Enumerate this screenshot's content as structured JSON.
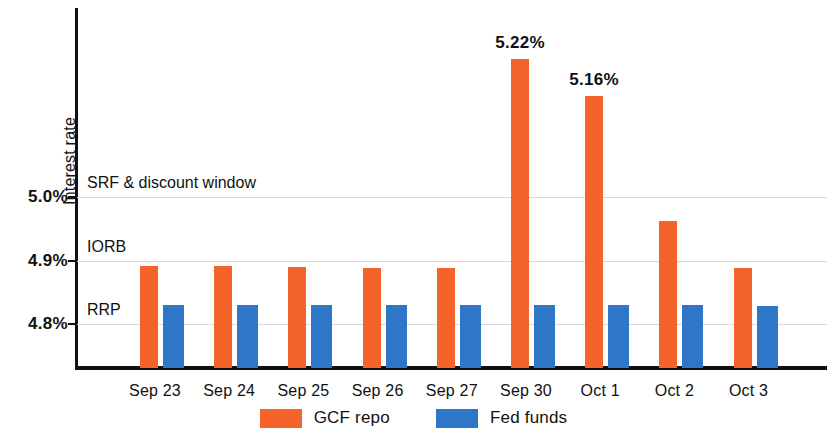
{
  "chart_data": {
    "type": "bar",
    "title": "",
    "xlabel": "",
    "ylabel": "Interest rate",
    "categories": [
      "Sep 23",
      "Sep 24",
      "Sep 25",
      "Sep 26",
      "Sep 27",
      "Sep 30",
      "Oct 1",
      "Oct 2",
      "Oct 3"
    ],
    "series": [
      {
        "name": "GCF repo",
        "color": "#F4642A",
        "values": [
          4.891,
          4.891,
          4.89,
          4.889,
          4.889,
          5.22,
          5.16,
          4.962,
          4.888
        ],
        "point_labels": [
          "",
          "",
          "",
          "",
          "",
          "5.22%",
          "5.16%",
          "",
          ""
        ]
      },
      {
        "name": "Fed funds",
        "color": "#2D76C8",
        "values": [
          4.83,
          4.83,
          4.83,
          4.83,
          4.83,
          4.83,
          4.83,
          4.83,
          4.828
        ],
        "point_labels": [
          "",
          "",
          "",
          "",
          "",
          "",
          "",
          "",
          ""
        ]
      }
    ],
    "ylim": [
      4.73,
      5.3
    ],
    "yticks": [
      4.8,
      4.9,
      5.0
    ],
    "ytick_labels": [
      "4.8%",
      "4.9%",
      "5.0%"
    ],
    "grid": true,
    "legend_position": "bottom-center",
    "reference_lines": [
      {
        "label": "SRF & discount window",
        "value": 5.0
      },
      {
        "label": "IORB",
        "value": 4.9
      },
      {
        "label": "RRP",
        "value": 4.8
      }
    ]
  },
  "axis": {
    "y_title": "Interest rate",
    "tick_5_0": "5.0%",
    "tick_4_9": "4.9%",
    "tick_4_8": "4.8%"
  },
  "reference_labels": {
    "srf": "SRF & discount window",
    "iorb": "IORB",
    "rrp": "RRP"
  },
  "xlabels": {
    "c0": "Sep 23",
    "c1": "Sep 24",
    "c2": "Sep 25",
    "c3": "Sep 26",
    "c4": "Sep 27",
    "c5": "Sep 30",
    "c6": "Oct 1",
    "c7": "Oct 2",
    "c8": "Oct 3"
  },
  "annotations": {
    "sep30_value": "5.22%",
    "oct1_value": "5.16%"
  },
  "legend": {
    "gcf_label": "GCF repo",
    "fed_label": "Fed funds",
    "gcf_color": "#F4642A",
    "fed_color": "#2D76C8"
  }
}
